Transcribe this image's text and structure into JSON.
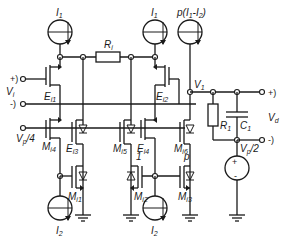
{
  "diagram": {
    "type": "circuit-schematic",
    "current_sources": {
      "i1_left": "I",
      "i1_left_sub": "1",
      "i1_mid": "I",
      "i1_mid_sub": "1",
      "ip": "p(I",
      "ip_sub1": "1",
      "ip_mid": "-I",
      "ip_sub2": "2",
      "ip_end": ")",
      "i2_left": "I",
      "i2_left_sub": "2",
      "i2_mid": "I",
      "i2_mid_sub": "2"
    },
    "resistors": {
      "ri": "R",
      "ri_sub": "i",
      "r1": "R",
      "r1_sub": "1"
    },
    "capacitor": {
      "c1": "C",
      "c1_sub": "1"
    },
    "transistors": {
      "ei1": "E",
      "ei1_sub": "i1",
      "ei2": "E",
      "ei2_sub": "i2",
      "ei3": "E",
      "ei3_sub": "i3",
      "ei4": "E",
      "ei4_sub": "i4",
      "mi1": "M",
      "mi1_sub": "i1",
      "mi2": "M",
      "mi2_sub": "i2",
      "mi3": "M",
      "mi3_sub": "i3",
      "mi4": "M",
      "mi4_sub": "i4",
      "mi5": "M",
      "mi5_sub": "i5",
      "mi6": "M",
      "mi6_sub": "i6"
    },
    "ratio_labels": {
      "one": "1",
      "p": "p"
    },
    "terminals": {
      "vi_plus": "+)",
      "vi_minus": "-)",
      "vi": "V",
      "vi_sub": "i",
      "vp4": "V",
      "vp4_sub": "p",
      "vp4_end": "/4",
      "v1": "V",
      "v1_sub": "1",
      "vd_plus": "+)",
      "vd_minus": "-)",
      "vd": "V",
      "vd_sub": "d",
      "vp2": "V",
      "vp2_sub": "p",
      "vp2_end": "/2"
    },
    "voltage_source": {
      "plus": "+",
      "minus": "-"
    }
  }
}
